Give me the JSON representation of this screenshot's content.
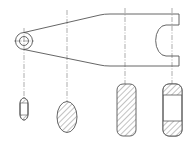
{
  "drawing": {
    "type": "engineering-drawing",
    "description": "Tapered lever arm with eye at left and open slot at right, with four removed cross-sections below",
    "colors": {
      "line": "#555555",
      "centerline": "#777777",
      "background": "#ffffff"
    },
    "centerlines_x": [
      24,
      67,
      125,
      172
    ],
    "sections": [
      {
        "name": "section-1",
        "shape": "small-oval",
        "hatch": "ends-only"
      },
      {
        "name": "section-2",
        "shape": "ellipse",
        "hatch": "full"
      },
      {
        "name": "section-3",
        "shape": "rounded-rect",
        "hatch": "full"
      },
      {
        "name": "section-4",
        "shape": "rounded-rect",
        "hatch": "ends-only"
      }
    ]
  }
}
